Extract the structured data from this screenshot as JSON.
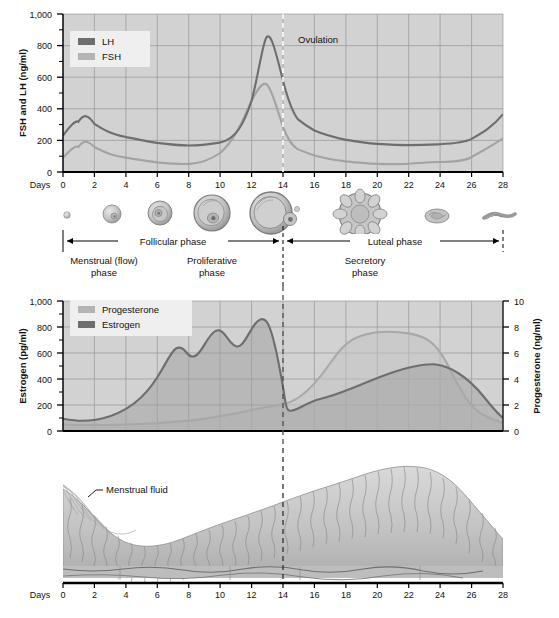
{
  "figure": {
    "day_axis_label": "Days",
    "day_ticks": [
      0,
      2,
      4,
      6,
      8,
      10,
      12,
      14,
      16,
      18,
      20,
      22,
      24,
      26,
      28
    ],
    "ovulation_label": "Ovulation",
    "ovulation_day": 14
  },
  "colors": {
    "plot_background": "#d2d2d2",
    "gridline": "#8d8d8d",
    "axis": "#000000",
    "lh_line": "#6e6e6e",
    "fsh_line": "#a8a8a8",
    "estrogen_line": "#6e6e6e",
    "progesterone_line": "#a8a8a8",
    "legend_background": "#efefef",
    "tissue_light": "#cfcfcf",
    "tissue_mid": "#b0b0b0",
    "tissue_dark": "#8a8a8a"
  },
  "panel_top": {
    "y_axis_label": "FSH and LH (ng/ml)",
    "y_ticks": [
      0,
      200,
      400,
      600,
      800,
      1000
    ],
    "y_tick_labels": [
      "0",
      "200",
      "400",
      "600",
      "800",
      "1,000"
    ],
    "y_minor_step": 100,
    "ylim": [
      0,
      1000
    ],
    "legend": [
      {
        "key": "lh",
        "label": "LH",
        "color": "#6e6e6e"
      },
      {
        "key": "fsh",
        "label": "FSH",
        "color": "#a8a8a8"
      }
    ]
  },
  "panel_ovary": {
    "follicle_caption_left": "Follicular phase",
    "follicle_caption_right": "Luteal phase",
    "sub_left_line1": "Menstrual (flow)",
    "sub_left_line2": "phase",
    "sub_mid_line1": "Proliferative",
    "sub_mid_line2": "phase",
    "sub_right_line1": "Secretory",
    "sub_right_line2": "phase",
    "stages": [
      {
        "name": "primordial-follicle",
        "day": 1,
        "size": 4
      },
      {
        "name": "primary-follicle",
        "day": 4,
        "size": 9
      },
      {
        "name": "secondary-follicle",
        "day": 7,
        "size": 12
      },
      {
        "name": "tertiary-follicle",
        "day": 10,
        "size": 18
      },
      {
        "name": "graafian-follicle",
        "day": 13,
        "size": 22
      },
      {
        "name": "corpus-luteum",
        "day": 19,
        "size": 22
      },
      {
        "name": "regressing-corpus-luteum",
        "day": 24,
        "size": 12
      },
      {
        "name": "corpus-albicans",
        "day": 27,
        "size": 10
      }
    ]
  },
  "panel_middle": {
    "y_axis_label_left": "Estrogen (pg/ml)",
    "y_axis_label_right": "Progesterone (ng/ml)",
    "y_ticks_left": [
      0,
      200,
      400,
      600,
      800,
      1000
    ],
    "y_tick_labels_left": [
      "0",
      "200",
      "400",
      "600",
      "800",
      "1,000"
    ],
    "y_ticks_right": [
      0,
      2,
      4,
      6,
      8,
      10
    ],
    "y_tick_labels_right": [
      "0",
      "2",
      "4",
      "6",
      "8",
      "10"
    ],
    "ylim_left": [
      0,
      1000
    ],
    "ylim_right": [
      0,
      10
    ],
    "legend": [
      {
        "key": "progesterone",
        "label": "Progesterone",
        "color": "#a8a8a8"
      },
      {
        "key": "estrogen",
        "label": "Estrogen",
        "color": "#6e6e6e"
      }
    ]
  },
  "panel_bottom": {
    "annotation": "Menstrual fluid",
    "day_axis_label": "Days"
  },
  "chart_data": [
    {
      "type": "line",
      "id": "gonadotropins",
      "title": "FSH and LH (ng/ml)",
      "xlabel": "Days",
      "ylabel": "FSH and LH (ng/ml)",
      "xlim": [
        0,
        28
      ],
      "ylim": [
        0,
        1000
      ],
      "grid": true,
      "legend_position": "top-left",
      "x": [
        0,
        1,
        2,
        3,
        4,
        5,
        6,
        7,
        8,
        9,
        10,
        11,
        12,
        12.5,
        13,
        13.3,
        13.6,
        14,
        14.5,
        15,
        16,
        17,
        18,
        19,
        20,
        21,
        22,
        23,
        24,
        25,
        26,
        27,
        28
      ],
      "series": [
        {
          "name": "LH",
          "color": "#6e6e6e",
          "values": [
            230,
            290,
            305,
            300,
            290,
            275,
            258,
            240,
            222,
            205,
            192,
            182,
            180,
            260,
            600,
            790,
            720,
            420,
            330,
            290,
            255,
            235,
            222,
            212,
            205,
            200,
            198,
            198,
            200,
            205,
            215,
            235,
            265
          ]
        },
        {
          "name": "FSH",
          "color": "#a8a8a8",
          "values": [
            90,
            140,
            158,
            152,
            140,
            128,
            115,
            102,
            92,
            82,
            78,
            76,
            78,
            140,
            350,
            450,
            390,
            235,
            190,
            165,
            142,
            128,
            118,
            110,
            103,
            98,
            94,
            92,
            92,
            95,
            102,
            120,
            150
          ]
        }
      ],
      "annotations": [
        {
          "text": "Ovulation",
          "x": 14,
          "type": "vertical-dashed-line"
        }
      ]
    },
    {
      "type": "area",
      "id": "ovarian-steroids",
      "title": "Estrogen and Progesterone",
      "xlabel": "Days",
      "ylabel": "Estrogen (pg/ml)",
      "ylabel_right": "Progesterone (ng/ml)",
      "xlim": [
        0,
        28
      ],
      "ylim": [
        0,
        1000
      ],
      "ylim_right": [
        0,
        10
      ],
      "grid": true,
      "legend_position": "top-left",
      "x": [
        0,
        1,
        2,
        3,
        4,
        5,
        6,
        7,
        8,
        9,
        9.5,
        10,
        10.5,
        11,
        11.5,
        12,
        12.5,
        13,
        13.3,
        13.6,
        14,
        14.3,
        15,
        16,
        17,
        18,
        19,
        20,
        21,
        22,
        23,
        24,
        25,
        26,
        27,
        28
      ],
      "series": [
        {
          "name": "Estrogen",
          "units": "pg/ml",
          "axis": "left",
          "color": "#6e6e6e",
          "values": [
            95,
            82,
            80,
            82,
            90,
            105,
            125,
            155,
            200,
            275,
            420,
            520,
            580,
            545,
            600,
            640,
            590,
            640,
            690,
            640,
            400,
            185,
            175,
            200,
            250,
            310,
            380,
            430,
            455,
            465,
            450,
            410,
            340,
            250,
            175,
            135
          ]
        },
        {
          "name": "Progesterone",
          "units": "ng/ml",
          "axis": "right",
          "color": "#a8a8a8",
          "values": [
            0.5,
            0.4,
            0.4,
            0.4,
            0.4,
            0.4,
            0.4,
            0.4,
            0.4,
            0.4,
            0.5,
            0.5,
            0.6,
            0.6,
            0.7,
            0.8,
            0.9,
            1.0,
            1.1,
            1.3,
            1.6,
            1.8,
            2.4,
            3.0,
            4.6,
            6.2,
            7.3,
            7.8,
            8.0,
            8.0,
            7.7,
            7.0,
            5.6,
            3.6,
            2.2,
            1.4
          ]
        }
      ],
      "annotations": [
        {
          "text": "",
          "x": 14,
          "type": "vertical-dashed-line"
        }
      ]
    },
    {
      "type": "area",
      "id": "endometrial-thickness",
      "title": "Endometrial cycle",
      "xlabel": "Days",
      "ylabel": "Relative endometrial thickness",
      "xlim": [
        0,
        28
      ],
      "grid": false,
      "x": [
        0,
        1,
        2,
        3,
        4,
        5,
        6,
        7,
        8,
        9,
        10,
        11,
        12,
        13,
        14,
        15,
        16,
        17,
        18,
        19,
        20,
        21,
        22,
        23,
        24,
        25,
        26,
        27,
        28
      ],
      "values": [
        88,
        82,
        72,
        58,
        44,
        36,
        33,
        35,
        38,
        42,
        46,
        50,
        55,
        60,
        64,
        68,
        73,
        78,
        83,
        88,
        92,
        95,
        95,
        93,
        88,
        80,
        70,
        62,
        56
      ],
      "annotations": [
        {
          "text": "Menstrual fluid",
          "x": 1.5,
          "type": "leader-label"
        },
        {
          "text": "",
          "x": 14,
          "type": "vertical-dashed-line"
        }
      ]
    }
  ]
}
